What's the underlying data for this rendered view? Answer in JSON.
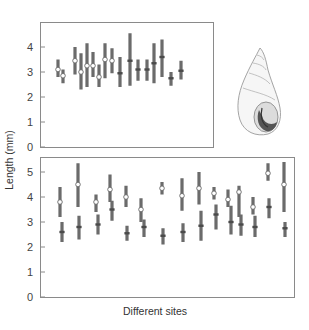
{
  "chart_data": [
    {
      "type": "range",
      "panel": "top",
      "title": "",
      "xlabel": "",
      "ylabel": "Length (mm)",
      "ylim": [
        0,
        4.7
      ],
      "yticks": [
        0,
        1,
        2,
        3,
        4
      ],
      "grid": false,
      "legend": null,
      "x_px": [
        58,
        63,
        75,
        81,
        87,
        93,
        99,
        105,
        112,
        120,
        130,
        138,
        147,
        154,
        162,
        171,
        181,
        190
      ],
      "series": [
        {
          "min": 2.8,
          "max": 3.5,
          "marker": 3.1,
          "marker_style": "open"
        },
        {
          "min": 2.55,
          "max": 3.1,
          "marker": 2.85,
          "marker_style": "open"
        },
        {
          "min": 2.9,
          "max": 4.0,
          "marker": 3.45,
          "marker_style": "open"
        },
        {
          "min": 2.3,
          "max": 3.75,
          "marker": 3.0,
          "marker_style": "open"
        },
        {
          "min": 2.4,
          "max": 4.15,
          "marker": 3.25,
          "marker_style": "open"
        },
        {
          "min": 2.8,
          "max": 3.8,
          "marker": 3.25,
          "marker_style": "open"
        },
        {
          "min": 2.4,
          "max": 3.3,
          "marker": 2.8,
          "marker_style": "open"
        },
        {
          "min": 2.75,
          "max": 4.15,
          "marker": 3.5,
          "marker_style": "open"
        },
        {
          "min": 2.95,
          "max": 3.95,
          "marker": 3.45,
          "marker_style": "open"
        },
        {
          "min": 2.4,
          "max": 3.6,
          "marker": 2.95,
          "marker_style": "filled"
        },
        {
          "min": 2.45,
          "max": 4.55,
          "marker": 3.45,
          "marker_style": "filled"
        },
        {
          "min": 2.65,
          "max": 3.5,
          "marker": 3.1,
          "marker_style": "filled"
        },
        {
          "min": 2.65,
          "max": 3.5,
          "marker": 3.1,
          "marker_style": "filled"
        },
        {
          "min": 2.55,
          "max": 4.15,
          "marker": 3.35,
          "marker_style": "filled"
        },
        {
          "min": 2.8,
          "max": 4.3,
          "marker": 3.6,
          "marker_style": "filled"
        },
        {
          "min": 2.45,
          "max": 3.0,
          "marker": 2.75,
          "marker_style": "filled"
        },
        {
          "min": 2.7,
          "max": 3.45,
          "marker": 3.05,
          "marker_style": "filled"
        }
      ]
    },
    {
      "type": "range",
      "panel": "bottom",
      "title": "",
      "xlabel": "Different sites",
      "ylabel": "Length (mm)",
      "ylim": [
        0,
        5.6
      ],
      "yticks": [
        0,
        1,
        2,
        3,
        4,
        5
      ],
      "grid": false,
      "legend": null,
      "sites": [
        {
          "x": 60,
          "upper": {
            "min": 3.2,
            "max": 4.4,
            "marker": 3.8
          },
          "lower": {
            "min": 2.2,
            "max": 3.0,
            "marker": 2.6
          },
          "upper_x": 60,
          "lower_x": 62
        },
        {
          "x": 78,
          "upper": {
            "min": 3.6,
            "max": 5.35,
            "marker": 4.5
          },
          "lower": {
            "min": 2.3,
            "max": 3.25,
            "marker": 2.8
          },
          "upper_x": 78,
          "lower_x": 79
        },
        {
          "x": 97,
          "upper": {
            "min": 3.4,
            "max": 4.1,
            "marker": 3.8
          },
          "lower": {
            "min": 2.5,
            "max": 3.3,
            "marker": 2.9
          },
          "upper_x": 96,
          "lower_x": 98
        },
        {
          "x": 111,
          "upper": {
            "min": 3.8,
            "max": 4.9,
            "marker": 4.3
          },
          "lower": {
            "min": 3.05,
            "max": 3.85,
            "marker": 3.5
          },
          "upper_x": 110,
          "lower_x": 112
        },
        {
          "x": 126,
          "upper": {
            "min": 3.6,
            "max": 4.45,
            "marker": 4.0
          },
          "lower": {
            "min": 2.25,
            "max": 2.85,
            "marker": 2.55
          },
          "upper_x": 126,
          "lower_x": 127
        },
        {
          "x": 142,
          "upper": {
            "min": 3.0,
            "max": 3.95,
            "marker": 3.5
          },
          "lower": {
            "min": 2.4,
            "max": 3.1,
            "marker": 2.8
          },
          "upper_x": 141,
          "lower_x": 144
        },
        {
          "x": 162,
          "upper": {
            "min": 4.1,
            "max": 4.6,
            "marker": 4.35
          },
          "lower": {
            "min": 2.1,
            "max": 2.75,
            "marker": 2.45
          },
          "upper_x": 162,
          "lower_x": 163
        },
        {
          "x": 182,
          "upper": {
            "min": 3.45,
            "max": 4.75,
            "marker": 4.05
          },
          "lower": {
            "min": 2.2,
            "max": 2.95,
            "marker": 2.6
          },
          "upper_x": 182,
          "lower_x": 183
        },
        {
          "x": 200,
          "upper": {
            "min": 3.7,
            "max": 5.0,
            "marker": 4.35
          },
          "lower": {
            "min": 2.25,
            "max": 3.45,
            "marker": 2.85
          },
          "upper_x": 199,
          "lower_x": 201
        },
        {
          "x": 215,
          "upper": {
            "min": 3.9,
            "max": 4.4,
            "marker": 4.15
          },
          "lower": {
            "min": 2.7,
            "max": 3.7,
            "marker": 3.3
          },
          "upper_x": 214,
          "lower_x": 216
        },
        {
          "x": 229,
          "upper": {
            "min": 3.6,
            "max": 4.3,
            "marker": 3.9
          },
          "lower": {
            "min": 2.5,
            "max": 3.65,
            "marker": 3.0
          },
          "upper_x": 228,
          "lower_x": 231
        },
        {
          "x": 240,
          "upper": {
            "min": 3.2,
            "max": 4.45,
            "marker": 4.2
          },
          "lower": {
            "min": 2.45,
            "max": 3.3,
            "marker": 2.9
          },
          "upper_x": 239,
          "lower_x": 241
        },
        {
          "x": 254,
          "upper": {
            "min": 3.3,
            "max": 4.0,
            "marker": 3.6
          },
          "lower": {
            "min": 2.4,
            "max": 3.25,
            "marker": 2.8
          },
          "upper_x": 253,
          "lower_x": 255
        },
        {
          "x": 268,
          "upper": {
            "min": 4.65,
            "max": 5.35,
            "marker": 4.95
          },
          "lower": {
            "min": 3.15,
            "max": 3.95,
            "marker": 3.6
          },
          "upper_x": 268,
          "lower_x": 269
        },
        {
          "x": 284,
          "upper": {
            "min": 3.4,
            "max": 5.4,
            "marker": 4.5
          },
          "lower": {
            "min": 2.4,
            "max": 3.0,
            "marker": 2.75
          },
          "upper_x": 284,
          "lower_x": 285
        }
      ]
    }
  ],
  "labels": {
    "ylabel": "Length (mm)",
    "xlabel": "Different sites",
    "top_yticks": [
      "0",
      "1",
      "2",
      "3",
      "4"
    ],
    "bottom_yticks": [
      "0",
      "1",
      "2",
      "3",
      "4",
      "5"
    ]
  },
  "illustration": {
    "name": "snail shell",
    "description": "pencil sketch of a high-spired snail shell with open aperture"
  },
  "colors": {
    "frame": "#8a8a8a",
    "bar": "#6b6b6b",
    "marker_fill_open": "#ffffff",
    "marker_fill_filled": "#4a4a4a",
    "text": "#444444"
  }
}
